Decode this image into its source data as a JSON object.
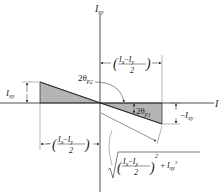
{
  "diagram": {
    "type": "mohr-circle-principal-angle",
    "axes": {
      "horizontal_label": "I",
      "vertical_label": "I",
      "vertical_label_sub": "xy"
    },
    "labels": {
      "top_dimension": {
        "num_a": "I",
        "num_a_sub": "x",
        "minus": "−",
        "num_b": "I",
        "num_b_sub": "y",
        "den": "2"
      },
      "bottom_dimension": {
        "num_a": "I",
        "num_a_sub": "x",
        "minus": "−",
        "num_b": "I",
        "num_b_sub": "y",
        "den": "2"
      },
      "left_height": {
        "main": "I",
        "sub": "xy"
      },
      "right_height": {
        "prefix": "−",
        "main": "I",
        "sub": "xy"
      },
      "angle_upper": {
        "main": "2θ",
        "sub": "p",
        "subsub": "2"
      },
      "angle_lower": {
        "main": "2θ",
        "sub": "p",
        "subsub": "1"
      },
      "radius": {
        "num_a": "I",
        "num_a_sub": "x",
        "minus": "−",
        "num_b": "I",
        "num_b_sub": "y",
        "den": "2",
        "power": "2",
        "plus": "+",
        "term": "I",
        "term_sub": "xy",
        "term_power": "2"
      }
    },
    "colors": {
      "line": "#222222",
      "fill": "#b4b4b4"
    }
  }
}
